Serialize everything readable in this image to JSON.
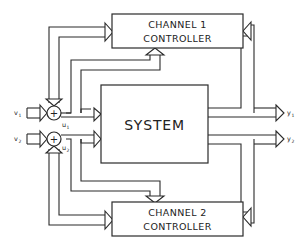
{
  "diagram": {
    "system": {
      "label": "SYSTEM"
    },
    "channel1": {
      "line1": "CHANNEL 1",
      "line2": "CONTROLLER"
    },
    "channel2": {
      "line1": "CHANNEL 2",
      "line2": "CONTROLLER"
    },
    "summing_symbol": "+",
    "signals": {
      "v1": {
        "base": "v",
        "sub": "1"
      },
      "v2": {
        "base": "v",
        "sub": "2"
      },
      "u1": {
        "base": "u",
        "sub": "1"
      },
      "u2": {
        "base": "u",
        "sub": "2"
      },
      "y1": {
        "base": "y",
        "sub": "1"
      },
      "y2": {
        "base": "y",
        "sub": "2"
      }
    },
    "colors": {
      "line": "#2a2a2a",
      "background": "#ffffff"
    }
  }
}
